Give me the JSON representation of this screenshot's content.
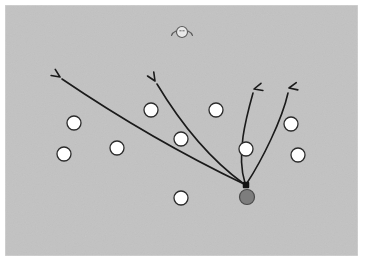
{
  "diagram": {
    "title": "Attack play diagram",
    "canvas": {
      "width": 367,
      "height": 271,
      "background_color": "#ffffff"
    },
    "field": {
      "name": "court-surface",
      "x": 5,
      "y": 5,
      "width": 353,
      "height": 251,
      "fill_color": "#c2c2c2",
      "border_color": "#d9d9d9"
    },
    "colors": {
      "field_gray": "#c2c2c2",
      "player_fill": "#ffffff",
      "player_stroke": "#2b2b2b",
      "ball_fill": "#7d7d7d",
      "ball_stroke": "#4a4a4a",
      "origin_marker": "#141414",
      "arrow_stroke": "#1a1a1a",
      "icon_fill": "#e8e8e8",
      "icon_stroke": "#5a5a5a"
    },
    "origin_marker": {
      "label": "ball-carrier-position",
      "x": 246,
      "y": 185,
      "size": 6.5
    },
    "ball": {
      "label": "ball",
      "x": 247,
      "y": 197,
      "r": 7.5
    },
    "head_icon": {
      "label": "referee-head-icon",
      "x": 182,
      "y": 32,
      "r": 5.5
    },
    "players": [
      {
        "id": "p1",
        "label": "player-1",
        "x": 74,
        "y": 123,
        "r": 7
      },
      {
        "id": "p2",
        "label": "player-2",
        "x": 64,
        "y": 154,
        "r": 7
      },
      {
        "id": "p3",
        "label": "player-3",
        "x": 117,
        "y": 148,
        "r": 7
      },
      {
        "id": "p4",
        "label": "player-4",
        "x": 151,
        "y": 110,
        "r": 7
      },
      {
        "id": "p5",
        "label": "player-5",
        "x": 181,
        "y": 139,
        "r": 7
      },
      {
        "id": "p6",
        "label": "player-6",
        "x": 216,
        "y": 110,
        "r": 7
      },
      {
        "id": "p7",
        "label": "player-7",
        "x": 246,
        "y": 149,
        "r": 7
      },
      {
        "id": "p8",
        "label": "player-8",
        "x": 291,
        "y": 124,
        "r": 7
      },
      {
        "id": "p9",
        "label": "player-9",
        "x": 298,
        "y": 155,
        "r": 7
      },
      {
        "id": "p10",
        "label": "player-10",
        "x": 181,
        "y": 198,
        "r": 7
      }
    ],
    "arrows": [
      {
        "id": "a1",
        "label": "pass-arrow-far-left",
        "path": "M 244 184 Q 152 140 62 79",
        "tip_x": 60,
        "tip_y": 77,
        "direction_deg": 214
      },
      {
        "id": "a2",
        "label": "pass-arrow-left",
        "path": "M 244 184 Q 196 149 157 84",
        "tip_x": 155,
        "tip_y": 81,
        "direction_deg": 238
      },
      {
        "id": "a3",
        "label": "run-arrow-up-left",
        "path": "M 245 183 C 236 155 246 118 253 93",
        "tip_x": 254,
        "tip_y": 89,
        "direction_deg": 345
      },
      {
        "id": "a4",
        "label": "run-arrow-up-right",
        "path": "M 247 183 C 262 160 282 120 288 93",
        "tip_x": 289,
        "tip_y": 88,
        "direction_deg": 348
      }
    ]
  }
}
